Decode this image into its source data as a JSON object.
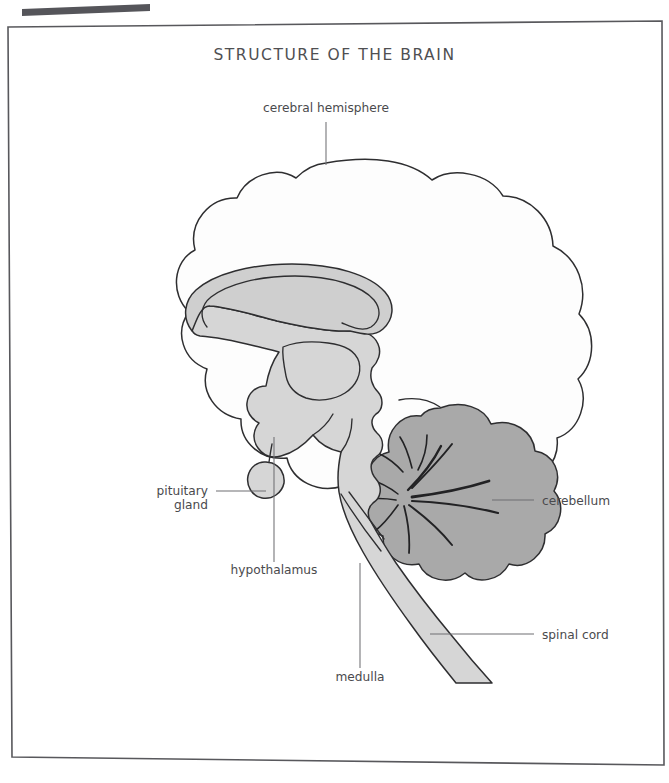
{
  "document": {
    "title": "STRUCTURE OF THE BRAIN",
    "type": "anatomical-diagram",
    "subject": "human brain midsagittal section",
    "page_background": "#ffffff",
    "frame_color": "#58585c"
  },
  "colors": {
    "title_text": "#4f4f52",
    "label_text": "#4a4a4d",
    "leader_line": "#6f6f73",
    "outline": "#2e2e30",
    "cerebrum_fill": "#fdfdfd",
    "brainstem_fill": "#d6d6d6",
    "corpus_callosum_fill": "#cfcfcf",
    "cerebellum_fill": "#a9a9a9",
    "scan_artifact": "#55555a"
  },
  "labels": [
    {
      "id": "cerebral-hemisphere",
      "text": "cerebral hemisphere",
      "anchor": "middle",
      "text_x": 326,
      "text_y": 112,
      "leader": "M326,122 L326,165"
    },
    {
      "id": "pituitary-gland",
      "text_line1": "pituitary",
      "text_line2": "gland",
      "anchor": "end",
      "text_x": 208,
      "text_y": 495,
      "text_y2": 508,
      "leader": "M216,491 L266,491"
    },
    {
      "id": "hypothalamus",
      "text": "hypothalamus",
      "anchor": "middle",
      "text_x": 274,
      "text_y": 572,
      "leader": "M274,562 L274,437"
    },
    {
      "id": "medulla",
      "text": "medulla",
      "anchor": "middle",
      "text_x": 360,
      "text_y": 679,
      "leader": "M360,668 L360,563"
    },
    {
      "id": "cerebellum",
      "text": "cerebellum",
      "anchor": "start",
      "text_x": 541,
      "text_y": 505,
      "leader": "M533,500 L492,500"
    },
    {
      "id": "spinal-cord",
      "text": "spinal cord",
      "anchor": "start",
      "text_x": 541,
      "text_y": 639,
      "leader": "M533,634 L430,634"
    }
  ],
  "structures": [
    {
      "id": "cerebrum",
      "name": "cerebral hemisphere",
      "fill": "#fdfdfd"
    },
    {
      "id": "corpus-callosum",
      "name": "corpus callosum",
      "fill": "#cfcfcf"
    },
    {
      "id": "diencephalon",
      "name": "thalamus and hypothalamus",
      "fill": "#d6d6d6"
    },
    {
      "id": "pituitary",
      "name": "pituitary gland",
      "fill": "#d6d6d6"
    },
    {
      "id": "brainstem",
      "name": "brainstem and medulla",
      "fill": "#d6d6d6"
    },
    {
      "id": "spinal-cord",
      "name": "spinal cord",
      "fill": "#d6d6d6"
    },
    {
      "id": "cerebellum",
      "name": "cerebellum",
      "fill": "#a9a9a9"
    }
  ]
}
